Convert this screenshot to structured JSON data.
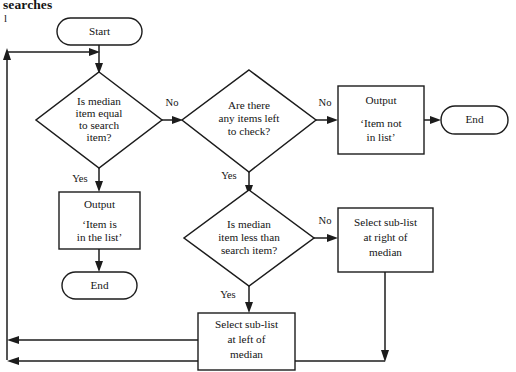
{
  "page": {
    "heading": "searches",
    "marginal_note": "l"
  },
  "colors": {
    "stroke": "#1c1c1c",
    "fill": "#ffffff",
    "text": "#141414",
    "background": "#ffffff"
  },
  "diagram": {
    "type": "flowchart",
    "nodes": {
      "start": {
        "shape": "terminator",
        "label": "Start"
      },
      "decision_equal": {
        "shape": "decision",
        "lines": [
          "Is median",
          "item equal",
          "to search",
          "item?"
        ]
      },
      "decision_items_left": {
        "shape": "decision",
        "lines": [
          "Are there",
          "any items left",
          "to check?"
        ]
      },
      "output_in_list": {
        "shape": "process",
        "lines": [
          "Output",
          "‘Item is",
          "in the list’"
        ]
      },
      "end_left": {
        "shape": "terminator",
        "label": "End"
      },
      "output_not_in_list": {
        "shape": "process",
        "lines": [
          "Output",
          "‘Item not",
          "in list’"
        ]
      },
      "end_right": {
        "shape": "terminator",
        "label": "End"
      },
      "decision_less_than": {
        "shape": "decision",
        "lines": [
          "Is median",
          "item less than",
          "search item?"
        ]
      },
      "select_right": {
        "shape": "process",
        "lines": [
          "Select sub-list",
          "at right of",
          "median"
        ]
      },
      "select_left": {
        "shape": "process",
        "lines": [
          "Select sub-list",
          "at left of",
          "median"
        ]
      }
    },
    "edge_labels": {
      "equal_no": "No",
      "equal_yes": "Yes",
      "items_left_no": "No",
      "items_left_yes": "Yes",
      "less_than_no": "No",
      "less_than_yes": "Yes"
    }
  }
}
